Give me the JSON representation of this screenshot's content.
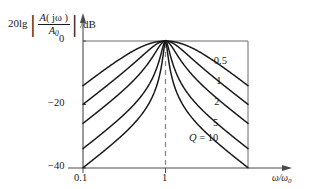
{
  "figure": {
    "y_axis_label_lead": "20lg",
    "y_axis_label_num_prefix": "A",
    "y_axis_label_num_arg": "( jω )",
    "y_axis_label_den": "A",
    "y_axis_label_den_sub": "0",
    "y_axis_label_unit": "/dB",
    "x_axis_label_num": "ω",
    "x_axis_label_den": "ω",
    "x_axis_label_den_sub": "0"
  },
  "chart_data": {
    "type": "line",
    "title": "",
    "xlabel": "ω/ω₀",
    "ylabel": "20lg |A(jω)/A₀| /dB",
    "xscale": "log",
    "xlim": [
      0.1,
      10
    ],
    "ylim": [
      -40,
      0
    ],
    "xticks": [
      0.1,
      1
    ],
    "xticklabels": [
      "0.1",
      "1"
    ],
    "yticks": [
      0,
      -20,
      -40
    ],
    "yticklabels": [
      "0",
      "−20",
      "−40"
    ],
    "grid": false,
    "legend_position": "inline-right",
    "dashed_marker_x": 1,
    "formula": "20*log10(1/sqrt(1+Q^2*(x-1/x)^2))",
    "series": [
      {
        "name": "0.5",
        "label": "0.5",
        "Q": 0.5,
        "label_x": 4.3,
        "label_y": -6.5,
        "x": [
          0.1,
          0.15,
          0.22,
          0.32,
          0.46,
          0.68,
          1.0,
          1.47,
          2.15,
          3.16,
          4.64,
          6.81,
          10.0
        ],
        "y": [
          -13.9,
          -10.6,
          -7.7,
          -5.1,
          -3.0,
          -1.2,
          0.0,
          -1.2,
          -3.0,
          -5.1,
          -7.7,
          -10.6,
          -13.9
        ]
      },
      {
        "name": "1",
        "label": "1",
        "Q": 1.0,
        "label_x": 4.6,
        "label_y": -13.0,
        "x": [
          0.1,
          0.15,
          0.22,
          0.32,
          0.46,
          0.68,
          1.0,
          1.47,
          2.15,
          3.16,
          4.64,
          6.81,
          10.0
        ],
        "y": [
          -19.9,
          -16.5,
          -13.4,
          -10.5,
          -7.6,
          -4.3,
          0.0,
          -4.3,
          -7.6,
          -10.5,
          -13.4,
          -16.5,
          -19.9
        ]
      },
      {
        "name": "2",
        "label": "2",
        "Q": 2.0,
        "label_x": 4.35,
        "label_y": -19.5,
        "x": [
          0.1,
          0.15,
          0.22,
          0.32,
          0.46,
          0.68,
          1.0,
          1.47,
          2.15,
          3.16,
          4.64,
          6.81,
          10.0
        ],
        "y": [
          -25.9,
          -22.5,
          -19.4,
          -16.4,
          -13.3,
          -9.4,
          0.0,
          -9.4,
          -13.3,
          -16.4,
          -19.4,
          -22.5,
          -25.9
        ]
      },
      {
        "name": "5",
        "label": "5",
        "Q": 5.0,
        "label_x": 4.2,
        "label_y": -26.0,
        "x": [
          0.1,
          0.15,
          0.22,
          0.32,
          0.46,
          0.68,
          1.0,
          1.47,
          2.15,
          3.16,
          4.64,
          6.81,
          10.0
        ],
        "y": [
          -33.9,
          -30.4,
          -27.3,
          -24.3,
          -21.1,
          -16.9,
          0.0,
          -16.9,
          -21.1,
          -24.3,
          -27.3,
          -30.4,
          -33.9
        ]
      },
      {
        "name": "Q = 10",
        "label": "Q = 10",
        "Q": 10.0,
        "label_x": 2.15,
        "label_y": -31.0,
        "x": [
          0.1,
          0.15,
          0.22,
          0.32,
          0.46,
          0.68,
          1.0,
          1.47,
          2.15,
          3.16,
          4.64,
          6.81,
          10.0
        ],
        "y": [
          -39.9,
          -36.4,
          -33.3,
          -30.3,
          -27.0,
          -22.7,
          0.0,
          -22.7,
          -27.0,
          -30.3,
          -33.3,
          -36.4,
          -39.9
        ]
      }
    ]
  }
}
